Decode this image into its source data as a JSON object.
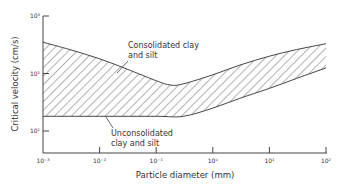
{
  "chart_data": {
    "type": "area",
    "title": "",
    "xlabel": "Particle diameter (mm)",
    "ylabel": "Critical velocity (cm/s)",
    "xscale": "log",
    "yscale": "log",
    "xlim": [
      0.001,
      100
    ],
    "ylim": [
      10,
      1000
    ],
    "x_ticks": [
      "10⁻³",
      "10⁻²",
      "10⁻¹",
      "10⁰",
      "10¹",
      "10²"
    ],
    "y_ticks": [
      "10³",
      "10²",
      "10¹"
    ],
    "grid": false,
    "legend": null,
    "series": [
      {
        "name": "Consolidated clay and silt",
        "role": "upper boundary",
        "x": [
          0.001,
          0.003,
          0.01,
          0.03,
          0.1,
          0.18,
          0.3,
          1,
          3,
          10,
          30,
          100
        ],
        "values": [
          350,
          260,
          180,
          120,
          75,
          63,
          66,
          95,
          140,
          200,
          260,
          330
        ]
      },
      {
        "name": "Unconsolidated clay and silt",
        "role": "lower boundary",
        "x": [
          0.001,
          0.01,
          0.1,
          0.3,
          1,
          3,
          10,
          30,
          100
        ],
        "values": [
          18,
          18,
          18,
          18,
          25,
          37,
          55,
          82,
          125
        ]
      }
    ],
    "fill_between": "hatched region between upper and lower boundaries",
    "annotations": [
      {
        "text": "Consolidated clay\nand silt",
        "points_to": "upper boundary"
      },
      {
        "text": "Unconsolidated\nclay and silt",
        "points_to": "lower boundary"
      }
    ]
  },
  "labels": {
    "ylabel": "Critical velocity (cm/s)",
    "xlabel": "Particle diameter (mm)",
    "consolidated_line1": "Consolidated clay",
    "consolidated_line2": "and silt",
    "unconsolidated_line1": "Unconsolidated",
    "unconsolidated_line2": "clay and silt"
  },
  "colors": {
    "line": "#444444",
    "hatch": "#555555",
    "text": "#333333",
    "background": "#ffffff"
  }
}
